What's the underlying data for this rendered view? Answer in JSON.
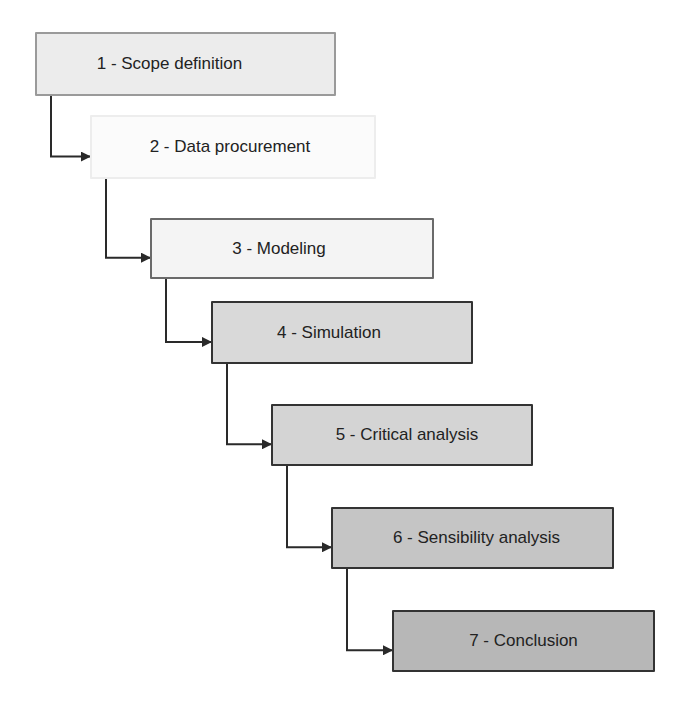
{
  "diagram": {
    "type": "staircase-process-flow",
    "steps": [
      {
        "id": 1,
        "label": "1 - Scope definition",
        "fill": "#ececec"
      },
      {
        "id": 2,
        "label": "2 - Data procurement",
        "fill": "#fbfbfb"
      },
      {
        "id": 3,
        "label": "3 - Modeling",
        "fill": "#f4f4f4"
      },
      {
        "id": 4,
        "label": "4 - Simulation",
        "fill": "#d9d9d9"
      },
      {
        "id": 5,
        "label": "5 - Critical analysis",
        "fill": "#d4d4d4"
      },
      {
        "id": 6,
        "label": "6 - Sensibility analysis",
        "fill": "#c5c5c5"
      },
      {
        "id": 7,
        "label": "7 - Conclusion",
        "fill": "#b7b7b7"
      }
    ],
    "edges": [
      {
        "from": 1,
        "to": 2
      },
      {
        "from": 2,
        "to": 3
      },
      {
        "from": 3,
        "to": 4
      },
      {
        "from": 4,
        "to": 5
      },
      {
        "from": 5,
        "to": 6
      },
      {
        "from": 6,
        "to": 7
      }
    ],
    "connector_color": "#2a2a2a"
  }
}
